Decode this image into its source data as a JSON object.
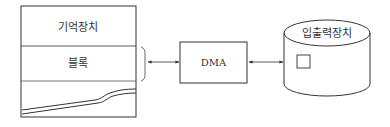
{
  "diagram": {
    "type": "DMA data transfer block diagram",
    "memory": {
      "title": "기억장치",
      "block_label": "블록"
    },
    "controller": {
      "label": "DMA"
    },
    "io_device": {
      "label": "입출력장치"
    },
    "connections": [
      {
        "from": "블록",
        "to": "DMA",
        "direction": "bidirectional"
      },
      {
        "from": "DMA",
        "to": "입출력장치",
        "direction": "bidirectional"
      }
    ],
    "colors": {
      "stroke": "#333333",
      "background": "#ffffff"
    }
  }
}
